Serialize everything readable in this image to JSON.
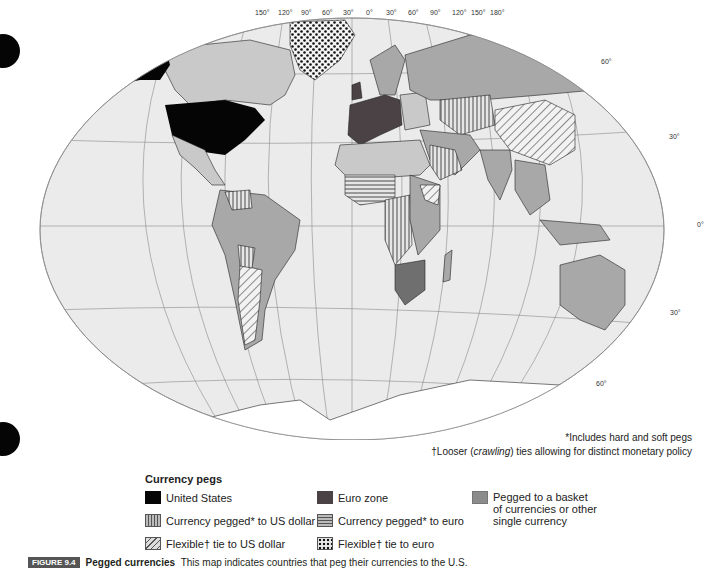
{
  "map": {
    "title": "Pegged currencies world map",
    "longitude_labels": [
      "150°",
      "120°",
      "90°",
      "60°",
      "30°",
      "0°",
      "30°",
      "60°",
      "90°",
      "120°",
      "150°",
      "180°"
    ],
    "latitude_labels_right": [
      "60°",
      "30°",
      "0°",
      "30°",
      "60°"
    ],
    "colors": {
      "ocean": "#ebebeb",
      "united_states": "#050505",
      "euro_zone": "#4a4244",
      "basket": "#a8a8a8",
      "other_land": "#c9c9c9",
      "antarctica": "#ffffff",
      "grid": "#8a8a8a"
    }
  },
  "notes": {
    "note1": "*Includes hard and soft pegs",
    "note2_prefix": "†Looser (",
    "note2_em": "crawling",
    "note2_suffix": ") ties allowing for distinct monetary policy"
  },
  "legend": {
    "title": "Currency pegs",
    "items": [
      {
        "key": "united_states",
        "label": "United States",
        "pattern": "solid-black"
      },
      {
        "key": "us_peg",
        "label": "Currency pegged* to US dollar",
        "pattern": "vertical-stripes"
      },
      {
        "key": "us_flex",
        "label": "Flexible† tie to US dollar",
        "pattern": "diagonal-stripes"
      },
      {
        "key": "euro_zone",
        "label": "Euro zone",
        "pattern": "solid-dark-gray"
      },
      {
        "key": "euro_peg",
        "label": "Currency pegged* to euro",
        "pattern": "horizontal-stripes"
      },
      {
        "key": "euro_flex",
        "label": "Flexible† tie to euro",
        "pattern": "dots"
      },
      {
        "key": "basket",
        "label_lines": [
          "Pegged to a basket",
          "of currencies or other",
          "single currency"
        ],
        "pattern": "solid-gray"
      }
    ]
  },
  "caption": {
    "badge": "FIGURE 9.4",
    "bold": "Pegged currencies",
    "text": "This map indicates countries that peg their currencies to the U.S."
  }
}
